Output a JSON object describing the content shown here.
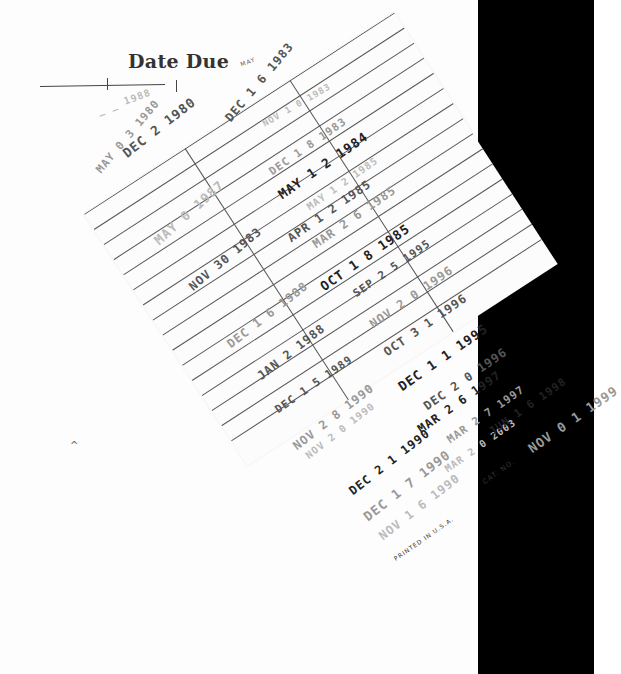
{
  "card": {
    "title": "Date Due",
    "header_stamp_partial": "MAY",
    "footer_printed": "PRINTED IN U.S.A.",
    "footer_cat": "CAT. NO.",
    "colors": {
      "paper": "#fcfcfc",
      "ink": "#222222",
      "rules": "#555555",
      "background_right": "#000000"
    }
  },
  "stamps": {
    "col1": [
      {
        "text": "_ _ 1988"
      },
      {
        "text": "MAY 0 3 1980"
      },
      {
        "text": "DEC 2 1980"
      },
      {
        "text": "MAY 0 1987"
      },
      {
        "text": "NOV 30 1983"
      },
      {
        "text": "DEC 1 6 1988"
      },
      {
        "text": "JAN 2 1988"
      },
      {
        "text": "DEC 1 5 1989"
      },
      {
        "text": "NOV 2 8 1990"
      },
      {
        "text": "NOV 2 0 1990"
      },
      {
        "text": "DEC 2 1 1990"
      },
      {
        "text": "DEC 1 7 1990"
      },
      {
        "text": "NOV 1 6 1990"
      }
    ],
    "col2": [
      {
        "text": "DEC 1 6 1983"
      },
      {
        "text": "NOV 1 0 1983"
      },
      {
        "text": "DEC 1 8 1983"
      },
      {
        "text": "MAY 1 2 1984"
      },
      {
        "text": "MAY 1 2 1985"
      },
      {
        "text": "APR 1 2 1985"
      },
      {
        "text": "MAR 2 6 1985"
      },
      {
        "text": "OCT 1 8 1985"
      },
      {
        "text": "SEP 2 5 1995"
      },
      {
        "text": "NOV 2 0 1996"
      },
      {
        "text": "OCT 3 1 1996"
      },
      {
        "text": "DEC 1 1 1995"
      },
      {
        "text": "DEC 2 0 1996"
      },
      {
        "text": "MAR 2 6 1997"
      },
      {
        "text": "MAR 2 7 1997"
      },
      {
        "text": "MAR 2 0 2003"
      }
    ],
    "col3": [
      {
        "text": "JUN 1 6 1998"
      },
      {
        "text": "NOV 0 1 1999"
      }
    ]
  },
  "stray_mark": "^"
}
